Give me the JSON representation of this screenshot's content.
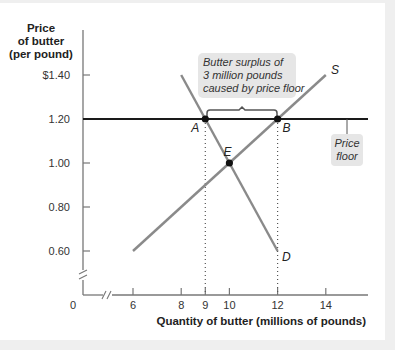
{
  "chart_data": {
    "type": "line",
    "title": "",
    "ylabel": [
      "Price",
      "of butter",
      "(per pound)"
    ],
    "xlabel": "Quantity of butter (millions of pounds)",
    "y_ticks": [
      "$1.40",
      "1.20",
      "1.00",
      "0.80",
      "0.60"
    ],
    "y_tick_values": [
      1.4,
      1.2,
      1.0,
      0.8,
      0.6
    ],
    "x_ticks": [
      "6",
      "8",
      "9",
      "10",
      "12",
      "14"
    ],
    "x_tick_values": [
      6,
      8,
      9,
      10,
      12,
      14
    ],
    "origin_label": "0",
    "xlim": [
      0,
      15.7
    ],
    "ylim": [
      0,
      1.55
    ],
    "axis_breaks": true,
    "grid": false,
    "series": [
      {
        "name": "S",
        "label": "S",
        "kind": "supply",
        "x": [
          6,
          14
        ],
        "y": [
          0.6,
          1.4
        ],
        "color": "#8a8a8a"
      },
      {
        "name": "D",
        "label": "D",
        "kind": "demand",
        "x": [
          8,
          12
        ],
        "y": [
          1.4,
          0.6
        ],
        "color": "#8a8a8a"
      },
      {
        "name": "Price floor",
        "kind": "horizontal",
        "y": 1.2,
        "x": [
          0,
          15.7
        ],
        "color": "#1a1a1a"
      }
    ],
    "points": [
      {
        "label": "A",
        "x": 9,
        "y": 1.2
      },
      {
        "label": "B",
        "x": 12,
        "y": 1.2
      },
      {
        "label": "E",
        "x": 10,
        "y": 1.0
      }
    ],
    "annotations": [
      {
        "text": [
          "Butter surplus of",
          "3 million pounds",
          "caused by price floor"
        ],
        "bracket_from": 9,
        "bracket_to": 12,
        "at_y": 1.2
      },
      {
        "text": [
          "Price",
          "floor"
        ],
        "points_to": "price floor line"
      }
    ],
    "colors": {
      "curves": "#8a8a8a",
      "floor": "#1a1a1a",
      "callout_bg": "#e6e6e6"
    }
  }
}
